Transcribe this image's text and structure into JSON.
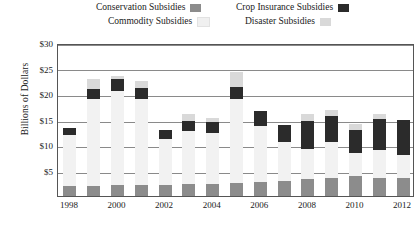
{
  "chart_data": {
    "type": "bar",
    "subtype": "stacked-bar",
    "title": "",
    "xlabel": "",
    "ylabel": "Billions of Dollars",
    "ylim": [
      0,
      30
    ],
    "ytick_labels": [
      "$30",
      "$25",
      "$20",
      "$15",
      "$10",
      "$5"
    ],
    "ytick_values": [
      30,
      25,
      20,
      15,
      10,
      5
    ],
    "ytick_prefix": "$",
    "grid": true,
    "legend_position": "top",
    "categories": [
      1998,
      1999,
      2000,
      2001,
      2002,
      2003,
      2004,
      2005,
      2006,
      2007,
      2008,
      2009,
      2010,
      2011,
      2012
    ],
    "xtick_labels": [
      "1998",
      "2000",
      "2002",
      "2004",
      "2006",
      "2008",
      "2010",
      "2012"
    ],
    "xtick_values": [
      1998,
      2000,
      2002,
      2004,
      2006,
      2008,
      2010,
      2012
    ],
    "series": [
      {
        "name": "Conservation Subsidies",
        "color": "#8c8c8c",
        "values": [
          2.0,
          2.0,
          2.1,
          2.1,
          2.2,
          2.3,
          2.4,
          2.5,
          2.8,
          3.0,
          3.3,
          3.6,
          3.9,
          3.6,
          3.6
        ]
      },
      {
        "name": "Commodity Subsidies",
        "color": "#f0f0f0",
        "values": [
          10.0,
          17.0,
          18.5,
          17.0,
          9.0,
          10.5,
          10.0,
          16.5,
          11.0,
          7.5,
          6.0,
          7.0,
          4.5,
          5.5,
          4.5
        ]
      },
      {
        "name": "Crop Insurance Subsidies",
        "color": "#2b2b2b",
        "values": [
          1.3,
          2.0,
          2.4,
          2.1,
          1.8,
          2.0,
          2.2,
          2.4,
          2.8,
          3.5,
          5.5,
          5.0,
          4.5,
          6.0,
          6.8
        ]
      },
      {
        "name": "Disaster Subsidies",
        "color": "#d9d9d9",
        "values": [
          0.0,
          2.0,
          0.5,
          1.3,
          0.0,
          1.2,
          0.6,
          3.0,
          0.0,
          0.0,
          1.3,
          1.3,
          1.3,
          1.0,
          0.0
        ]
      }
    ],
    "totals": [
      13.3,
      23.0,
      23.5,
      22.5,
      13.0,
      16.0,
      15.2,
      24.4,
      16.6,
      14.0,
      16.1,
      16.9,
      14.2,
      16.1,
      14.9
    ]
  },
  "legend": {
    "items": [
      {
        "label": "Conservation Subsidies",
        "color": "#8c8c8c"
      },
      {
        "label": "Crop Insurance Subsidies",
        "color": "#2b2b2b"
      },
      {
        "label": "Commodity Subsidies",
        "color": "#f0f0f0"
      },
      {
        "label": "Disaster Subsidies",
        "color": "#d9d9d9"
      }
    ]
  },
  "axes": {
    "ylabel": "Billions of Dollars"
  }
}
